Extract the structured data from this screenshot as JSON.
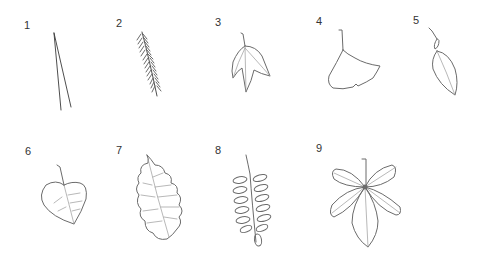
{
  "figure": {
    "items": [
      {
        "number": "1",
        "leaf": "pine-needles-icon"
      },
      {
        "number": "2",
        "leaf": "hemlock-sprig-icon"
      },
      {
        "number": "3",
        "leaf": "sweetgum-leaf-icon"
      },
      {
        "number": "4",
        "leaf": "ginkgo-leaf-icon"
      },
      {
        "number": "5",
        "leaf": "elliptical-leaf-icon"
      },
      {
        "number": "6",
        "leaf": "heart-shaped-leaf-icon"
      },
      {
        "number": "7",
        "leaf": "oak-leaf-icon"
      },
      {
        "number": "8",
        "leaf": "pinnate-compound-leaf-icon"
      },
      {
        "number": "9",
        "leaf": "palmate-compound-leaf-icon"
      }
    ],
    "colors": {
      "background": "#ffffff",
      "stroke": "#6b6b6b",
      "label": "#333333"
    }
  }
}
